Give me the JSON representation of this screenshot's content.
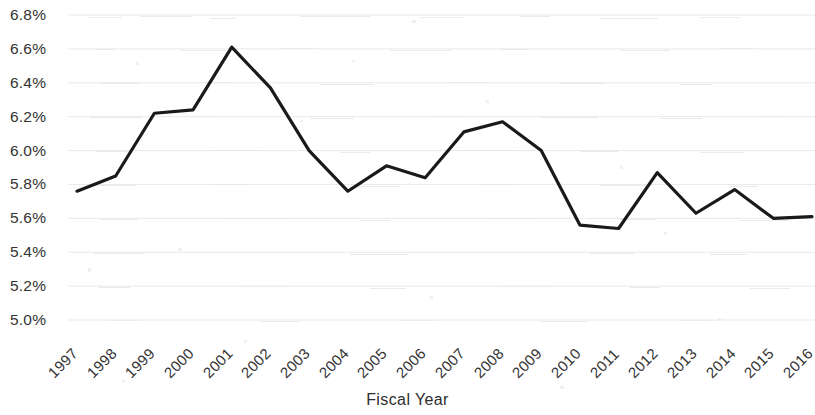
{
  "chart_data": {
    "type": "line",
    "title": "",
    "subtitle": "",
    "xlabel": "Fiscal Year",
    "ylabel": "",
    "categories": [
      "1997",
      "1998",
      "1999",
      "2000",
      "2001",
      "2002",
      "2003",
      "2004",
      "2005",
      "2006",
      "2007",
      "2008",
      "2009",
      "2010",
      "2011",
      "2012",
      "2013",
      "2014",
      "2015",
      "2016"
    ],
    "x": [
      1997,
      1998,
      1999,
      2000,
      2001,
      2002,
      2003,
      2004,
      2005,
      2006,
      2007,
      2008,
      2009,
      2010,
      2011,
      2012,
      2013,
      2014,
      2015,
      2016
    ],
    "values": [
      5.76,
      5.85,
      6.22,
      6.24,
      6.61,
      6.37,
      6.0,
      5.76,
      5.91,
      5.84,
      6.11,
      6.17,
      6.0,
      5.56,
      5.54,
      5.87,
      5.63,
      5.77,
      5.6,
      5.61
    ],
    "series": [
      {
        "name": "",
        "values": [
          5.76,
          5.85,
          6.22,
          6.24,
          6.61,
          6.37,
          6.0,
          5.76,
          5.91,
          5.84,
          6.11,
          6.17,
          6.0,
          5.56,
          5.54,
          5.87,
          5.63,
          5.77,
          5.6,
          5.61
        ],
        "color": "#1a1a1a"
      }
    ],
    "ylim": [
      5.0,
      6.8
    ],
    "ytick_values": [
      6.8,
      6.6,
      6.4,
      6.2,
      6.0,
      5.8,
      5.6,
      5.4,
      5.2,
      5.0
    ],
    "ytick_labels": [
      "6.8%",
      "6.6%",
      "6.4%",
      "6.2%",
      "6.0%",
      "5.8%",
      "5.6%",
      "5.4%",
      "5.2%",
      "5.0%"
    ],
    "value_format": "percent",
    "grid": true,
    "grid_axis": "y",
    "grid_color": "#e9e9e9",
    "legend": false,
    "legend_position": "none",
    "line_color": "#1a1a1a",
    "line_width": 3.2,
    "markers": false,
    "background": "#ffffff"
  },
  "axes": {
    "x_title": "Fiscal Year",
    "x_tick_rotation_degrees": -45
  }
}
